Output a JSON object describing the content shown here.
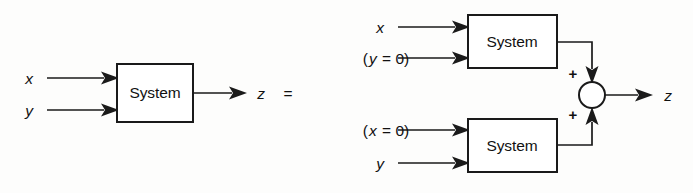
{
  "diagram": {
    "type": "block-diagram",
    "equation_operator": "=",
    "left_system": {
      "block_label": "System",
      "inputs": [
        {
          "label": "x",
          "style": "italic"
        },
        {
          "label": "y",
          "style": "italic"
        }
      ],
      "output": {
        "label": "z",
        "style": "italic"
      }
    },
    "right_system": {
      "top_block": {
        "block_label": "System",
        "inputs": [
          {
            "label": "x",
            "style": "italic",
            "parts": [
              {
                "text": "x",
                "italic": true
              }
            ]
          },
          {
            "label": "(y = 0)",
            "style": "mixed",
            "parts": [
              {
                "text": "(",
                "italic": false
              },
              {
                "text": "y",
                "italic": true
              },
              {
                "text": " = 0)",
                "italic": false
              }
            ]
          }
        ]
      },
      "bottom_block": {
        "block_label": "System",
        "inputs": [
          {
            "label": "(x = 0)",
            "style": "mixed",
            "parts": [
              {
                "text": "(",
                "italic": false
              },
              {
                "text": "x",
                "italic": true
              },
              {
                "text": " = 0)",
                "italic": false
              }
            ]
          },
          {
            "label": "y",
            "style": "italic",
            "parts": [
              {
                "text": "y",
                "italic": true
              }
            ]
          }
        ]
      },
      "summing_junction": {
        "shape": "circle",
        "top_sign": "+",
        "bottom_sign": "+"
      },
      "output": {
        "label": "z",
        "style": "italic"
      }
    },
    "colors": {
      "ink": "#1a1a1a",
      "paper": "#fdfdfc",
      "box_fill": "#ffffff"
    }
  }
}
